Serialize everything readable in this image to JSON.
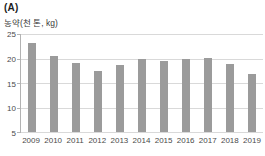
{
  "figure_label": "(A)",
  "colors": {
    "bar": "#9b9b9b",
    "gridline": "#d9d9d9",
    "axis": "#b3b3b3",
    "tick_text": "#4a4a4a",
    "label_text": "#3a3a3a"
  },
  "chart_data": {
    "type": "bar",
    "title": "(A)",
    "ylabel": "농약(천 톤, kg)",
    "xlabel": "",
    "categories": [
      "2009",
      "2010",
      "2011",
      "2012",
      "2013",
      "2014",
      "2015",
      "2016",
      "2017",
      "2018",
      "2019"
    ],
    "values": [
      23.2,
      20.5,
      19.1,
      17.5,
      18.7,
      19.9,
      19.5,
      20.0,
      20.1,
      18.8,
      16.8
    ],
    "ylim": [
      5,
      25
    ],
    "yticks": [
      25,
      20,
      15,
      10,
      5
    ],
    "grid": true,
    "legend_position": "none",
    "bar_width_px": 8
  }
}
